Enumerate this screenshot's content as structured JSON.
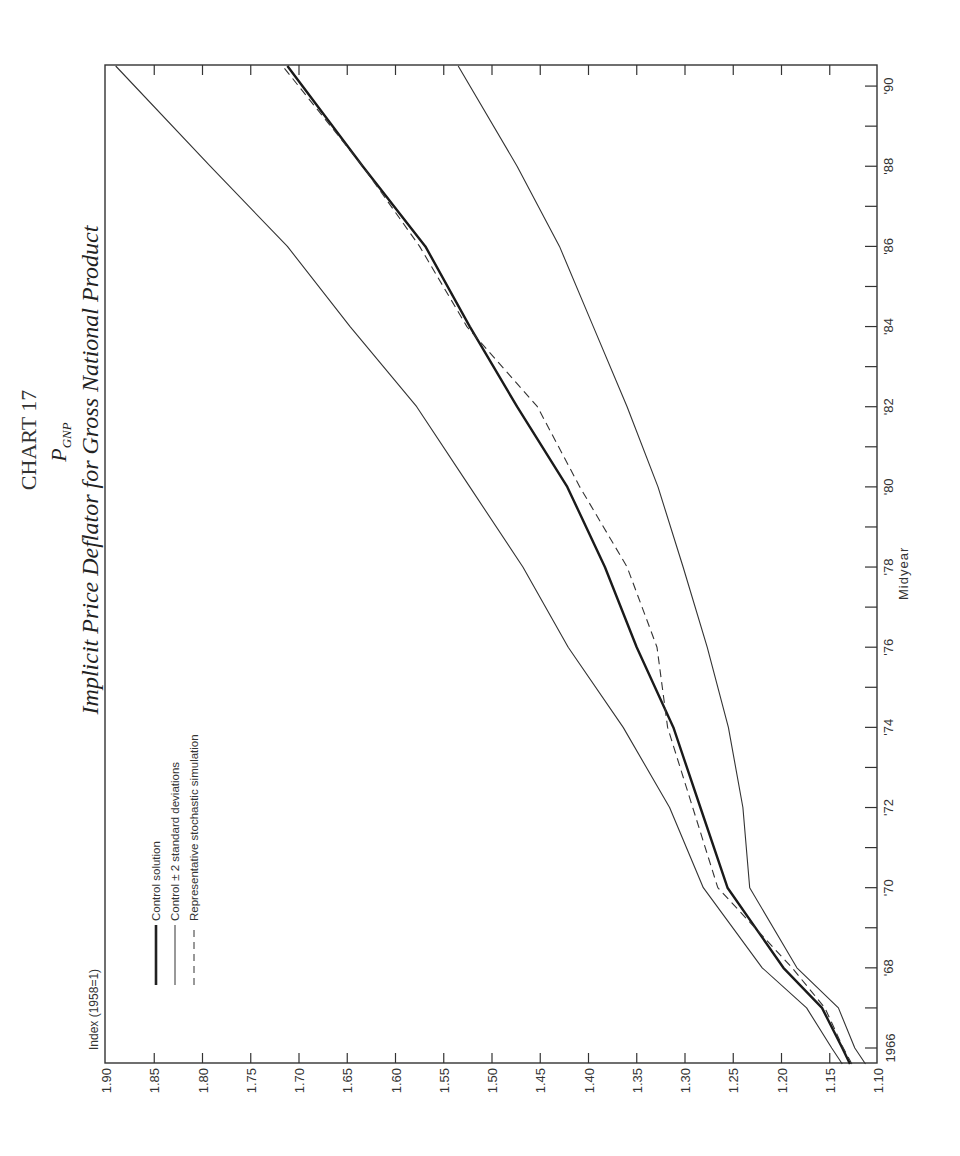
{
  "page": {
    "chart_heading": "CHART 17",
    "symbol_main": "P",
    "symbol_sub": "GNP",
    "title": "Implicit Price Deflator for Gross National Product",
    "index_label": "Index (1958=1)",
    "x_axis_label": "Midyear"
  },
  "legend": [
    {
      "label": "Control solution",
      "style": "thick"
    },
    {
      "label": "Control ± 2 standard deviations",
      "style": "thin"
    },
    {
      "label": "Representative stochastic simulation",
      "style": "dashed"
    }
  ],
  "chart_data": {
    "type": "line",
    "title": "Implicit Price Deflator for Gross National Product",
    "subtitle": "P_GNP",
    "xlabel": "Midyear",
    "ylabel": "Index (1958=1)",
    "xlim": [
      1965.6,
      1990.5
    ],
    "ylim": [
      1.1,
      1.9
    ],
    "grid": false,
    "legend_position": "upper-left",
    "orientation_note": "printed rotated 90° on page",
    "x_ticks": [
      "1966",
      "'68",
      "'70",
      "'72",
      "'74",
      "'76",
      "'78",
      "'80",
      "'82",
      "'84",
      "'86",
      "'88",
      "'90"
    ],
    "y_ticks": [
      "1.10",
      "1.15",
      "1.20",
      "1.25",
      "1.30",
      "1.35",
      "1.40",
      "1.45",
      "1.50",
      "1.55",
      "1.60",
      "1.65",
      "1.70",
      "1.75",
      "1.80",
      "1.85",
      "1.90"
    ],
    "x": [
      1965.6,
      1966,
      1967,
      1968,
      1970,
      1972,
      1974,
      1976,
      1978,
      1980,
      1982,
      1984,
      1986,
      1988,
      1990.5
    ],
    "series": [
      {
        "name": "Control + 2 standard deviations",
        "style": "thin",
        "values": [
          1.137,
          1.148,
          1.174,
          1.22,
          1.281,
          1.316,
          1.364,
          1.421,
          1.468,
          1.523,
          1.578,
          1.647,
          1.712,
          1.792,
          1.89
        ]
      },
      {
        "name": "Control solution",
        "style": "thick",
        "values": [
          1.129,
          1.137,
          1.158,
          1.198,
          1.256,
          1.284,
          1.312,
          1.35,
          1.383,
          1.422,
          1.474,
          1.523,
          1.569,
          1.634,
          1.712
        ]
      },
      {
        "name": "Representative stochastic simulation",
        "style": "dashed",
        "values": [
          1.127,
          1.136,
          1.155,
          1.189,
          1.266,
          1.292,
          1.318,
          1.329,
          1.36,
          1.409,
          1.453,
          1.526,
          1.575,
          1.634,
          1.717
        ]
      },
      {
        "name": "Control - 2 standard deviations",
        "style": "thin",
        "values": [
          1.113,
          1.124,
          1.141,
          1.184,
          1.233,
          1.24,
          1.255,
          1.277,
          1.302,
          1.328,
          1.36,
          1.395,
          1.43,
          1.474,
          1.535
        ]
      }
    ]
  }
}
